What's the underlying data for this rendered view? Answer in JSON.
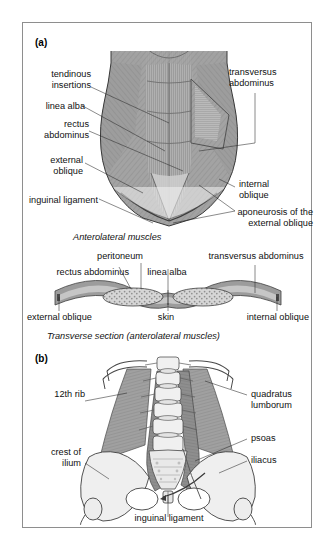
{
  "figure": {
    "panels": [
      {
        "tag": "(a)",
        "caption": "Anterolateral muscles",
        "labels": [
          {
            "id": "tendinous-insertions",
            "text": "tendinous\ninsertions"
          },
          {
            "id": "linea-alba",
            "text": "linea alba"
          },
          {
            "id": "rectus-abdominus",
            "text": "rectus\nabdominus"
          },
          {
            "id": "external-oblique",
            "text": "external\noblique"
          },
          {
            "id": "inguinal-ligament",
            "text": "inguinal ligament"
          },
          {
            "id": "transversus-abdominus",
            "text": "transversus\nabdominus"
          },
          {
            "id": "internal-oblique",
            "text": "internal\noblique"
          },
          {
            "id": "aponeurosis",
            "text": "aponeurosis of the\nexternal oblique"
          }
        ]
      },
      {
        "tag": "",
        "caption": "Transverse section (anterolateral muscles)",
        "labels": [
          {
            "id": "peritoneum",
            "text": "peritoneum"
          },
          {
            "id": "rectus-abdominus-ts",
            "text": "rectus abdominus"
          },
          {
            "id": "linea-alba-ts",
            "text": "linea alba"
          },
          {
            "id": "transversus-abdominus-ts",
            "text": "transversus abdominus"
          },
          {
            "id": "external-oblique-ts",
            "text": "external oblique"
          },
          {
            "id": "skin",
            "text": "skin"
          },
          {
            "id": "internal-oblique-ts",
            "text": "internal oblique"
          }
        ]
      },
      {
        "tag": "(b)",
        "caption": "",
        "labels": [
          {
            "id": "twelfth-rib",
            "text": "12th rib"
          },
          {
            "id": "crest-of-ilium",
            "text": "crest of\nilium"
          },
          {
            "id": "quadratus-lumborum",
            "text": "quadratus\nlumborum"
          },
          {
            "id": "psoas",
            "text": "psoas"
          },
          {
            "id": "iliacus",
            "text": "iliacus"
          },
          {
            "id": "inguinal-ligament-b",
            "text": "inguinal ligament"
          }
        ]
      }
    ]
  },
  "colors": {
    "frame": "#8e8e8e",
    "muscle_dark": "#8d8d8d",
    "muscle_mid": "#a6a6a6",
    "muscle_light": "#c2c2c2",
    "bone": "#ebebeb",
    "outline": "#3a3a3a",
    "leader": "#2b2b2b",
    "background": "#ffffff"
  }
}
